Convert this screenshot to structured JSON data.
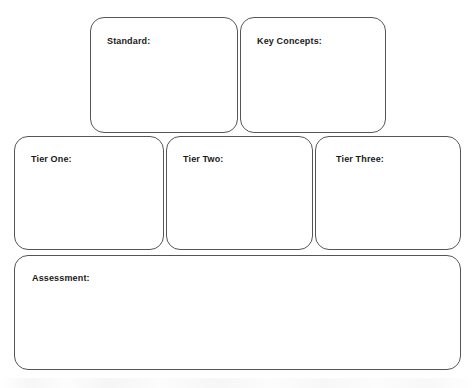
{
  "document": {
    "type": "graphic-organizer",
    "title": "Tiered Lesson Planning Organizer",
    "background_color": "#ffffff",
    "border_color": "#555555",
    "text_color": "#1a1a1a"
  },
  "rows": [
    {
      "name": "top-row",
      "boxes": [
        {
          "id": "standard",
          "label": "Standard:",
          "value": ""
        },
        {
          "id": "key-concepts",
          "label": "Key Concepts:",
          "value": ""
        }
      ]
    },
    {
      "name": "tier-row",
      "boxes": [
        {
          "id": "tier-one",
          "label": "Tier One:",
          "value": ""
        },
        {
          "id": "tier-two",
          "label": "Tier Two:",
          "value": ""
        },
        {
          "id": "tier-three",
          "label": "Tier Three:",
          "value": ""
        }
      ]
    },
    {
      "name": "assessment-row",
      "boxes": [
        {
          "id": "assessment",
          "label": "Assessment:",
          "value": ""
        }
      ]
    }
  ]
}
